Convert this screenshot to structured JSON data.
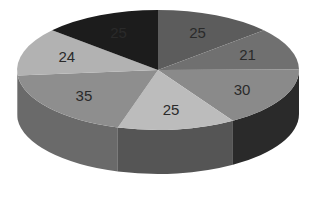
{
  "chart_data": {
    "type": "pie",
    "style": "3d",
    "title": "",
    "categories": [
      "Slice 1",
      "Slice 2",
      "Slice 3",
      "Slice 4",
      "Slice 5",
      "Slice 6",
      "Slice 7"
    ],
    "values": [
      25,
      21,
      30,
      25,
      35,
      24,
      25
    ],
    "labels": [
      "25",
      "21",
      "30",
      "25",
      "35",
      "24",
      "25"
    ],
    "colors": [
      "#5c5c5c",
      "#707070",
      "#8a8a8a",
      "#bcbcbc",
      "#8e8e8e",
      "#b2b2b2",
      "#1c1c1c"
    ],
    "side_colors": [
      "#3a3a3a",
      "#4a4a4a",
      "#2a2a2a",
      "#555555",
      "#6a6a6a",
      "#7a7a7a",
      "#111111"
    ],
    "start_angle_deg": -90,
    "direction": "clockwise",
    "legend": null,
    "data_labels": true
  }
}
